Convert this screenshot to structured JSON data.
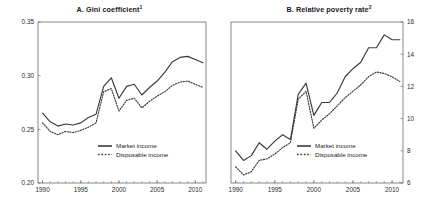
{
  "figure": {
    "panels": [
      {
        "id": "A",
        "title": "A. Gini coefficient",
        "title_superscript": "1"
      },
      {
        "id": "B",
        "title": "B. Relative poverty rate",
        "title_superscript": "2"
      }
    ],
    "legend": {
      "market_label": "Market income",
      "disposable_label": "Disposable income"
    }
  },
  "chart_data": [
    {
      "type": "line",
      "title": "A. Gini coefficient",
      "xlabel": "",
      "ylabel": "",
      "xlim": [
        1989.4,
        2011.4
      ],
      "ylim": [
        0.2,
        0.35
      ],
      "xticks": [
        1990,
        1995,
        2000,
        2005,
        2010
      ],
      "xticklabels": [
        "1990",
        "1995",
        "2000",
        "2005",
        "2010"
      ],
      "yticks": [
        0.2,
        0.25,
        0.3,
        0.35
      ],
      "yticklabels": [
        "0.20",
        "0.25",
        "0.30",
        "0.35"
      ],
      "yaxis_side": "left",
      "grid": false,
      "legend_position": "lower-center",
      "x": [
        1990,
        1991,
        1992,
        1993,
        1994,
        1995,
        1996,
        1997,
        1998,
        1999,
        2000,
        2001,
        2002,
        2003,
        2004,
        2005,
        2006,
        2007,
        2008,
        2009,
        2010,
        2011
      ],
      "series": [
        {
          "name": "Market income",
          "style": "solid",
          "values": [
            0.265,
            0.257,
            0.253,
            0.255,
            0.254,
            0.256,
            0.261,
            0.264,
            0.29,
            0.298,
            0.279,
            0.29,
            0.292,
            0.282,
            0.289,
            0.295,
            0.303,
            0.313,
            0.317,
            0.318,
            0.315,
            0.312
          ]
        },
        {
          "name": "Disposable income",
          "style": "dotted",
          "values": [
            0.256,
            0.248,
            0.245,
            0.248,
            0.247,
            0.249,
            0.252,
            0.256,
            0.285,
            0.288,
            0.267,
            0.277,
            0.279,
            0.27,
            0.276,
            0.281,
            0.285,
            0.291,
            0.294,
            0.295,
            0.292,
            0.289
          ]
        }
      ]
    },
    {
      "type": "line",
      "title": "B. Relative poverty rate",
      "xlabel": "",
      "ylabel": "",
      "xlim": [
        1989.4,
        2011.4
      ],
      "ylim": [
        6,
        16
      ],
      "xticks": [
        1990,
        1995,
        2000,
        2005,
        2010
      ],
      "xticklabels": [
        "1990",
        "1995",
        "2000",
        "2005",
        "2010"
      ],
      "yticks": [
        6,
        8,
        10,
        12,
        14,
        16
      ],
      "yticklabels": [
        "6",
        "8",
        "10",
        "12",
        "14",
        "16"
      ],
      "yaxis_side": "right",
      "grid": false,
      "legend_position": "lower-center",
      "x": [
        1990,
        1991,
        1992,
        1993,
        1994,
        1995,
        1996,
        1997,
        1998,
        1999,
        2000,
        2001,
        2002,
        2003,
        2004,
        2005,
        2006,
        2007,
        2008,
        2009,
        2010,
        2011
      ],
      "series": [
        {
          "name": "Market income",
          "style": "solid",
          "values": [
            8.0,
            7.4,
            7.7,
            8.5,
            8.1,
            8.6,
            9.0,
            8.7,
            11.5,
            12.2,
            10.2,
            11.0,
            11.0,
            11.6,
            12.6,
            13.1,
            13.5,
            14.4,
            14.4,
            15.2,
            14.9,
            14.9
          ]
        },
        {
          "name": "Disposable income",
          "style": "dotted",
          "values": [
            7.0,
            6.5,
            6.7,
            7.4,
            7.5,
            7.8,
            8.2,
            8.5,
            11.2,
            11.7,
            9.4,
            9.9,
            10.3,
            10.8,
            11.3,
            11.7,
            12.1,
            12.6,
            12.9,
            12.8,
            12.6,
            12.3
          ]
        }
      ]
    }
  ]
}
